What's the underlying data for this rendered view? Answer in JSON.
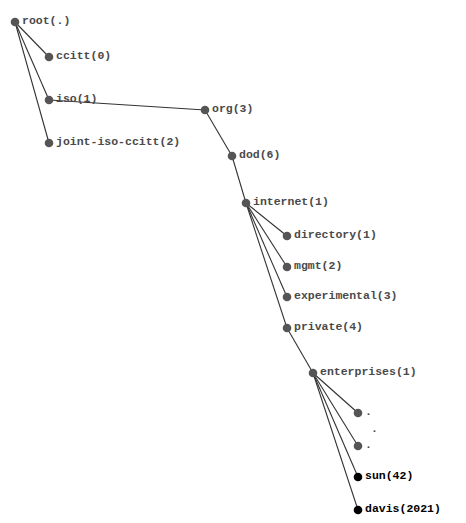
{
  "diagram": {
    "type": "tree",
    "title": "",
    "colors": {
      "node": "#555555",
      "highlight": "#000000",
      "edge": "#333333",
      "text": "#4a4a4a"
    },
    "nodes": [
      {
        "id": "root",
        "label": "root(.)",
        "x": 15,
        "y": 22,
        "highlight": false
      },
      {
        "id": "ccitt",
        "label": "ccitt(0)",
        "x": 49,
        "y": 57,
        "highlight": false
      },
      {
        "id": "iso",
        "label": "iso(1)",
        "x": 49,
        "y": 100,
        "highlight": false
      },
      {
        "id": "joint",
        "label": "joint-iso-ccitt(2)",
        "x": 49,
        "y": 143,
        "highlight": false
      },
      {
        "id": "org",
        "label": "org(3)",
        "x": 205,
        "y": 110,
        "highlight": false
      },
      {
        "id": "dod",
        "label": "dod(6)",
        "x": 232,
        "y": 156,
        "highlight": false
      },
      {
        "id": "internet",
        "label": "internet(1)",
        "x": 246,
        "y": 203,
        "highlight": false
      },
      {
        "id": "directory",
        "label": "directory(1)",
        "x": 287,
        "y": 236,
        "highlight": false
      },
      {
        "id": "mgmt",
        "label": "mgmt(2)",
        "x": 287,
        "y": 267,
        "highlight": false
      },
      {
        "id": "experimental",
        "label": "experimental(3)",
        "x": 287,
        "y": 297,
        "highlight": false
      },
      {
        "id": "private",
        "label": "private(4)",
        "x": 287,
        "y": 328,
        "highlight": false
      },
      {
        "id": "enterprises",
        "label": "enterprises(1)",
        "x": 313,
        "y": 373,
        "highlight": false
      },
      {
        "id": "dots1",
        "label": ".",
        "x": 358,
        "y": 413,
        "highlight": false
      },
      {
        "id": "dots2",
        "label": ".",
        "x": 358,
        "y": 446,
        "highlight": false
      },
      {
        "id": "sun",
        "label": "sun(42)",
        "x": 358,
        "y": 477,
        "highlight": true
      },
      {
        "id": "davis",
        "label": "davis(2021)",
        "x": 358,
        "y": 510,
        "highlight": true
      }
    ],
    "edges": [
      [
        "root",
        "ccitt"
      ],
      [
        "root",
        "iso"
      ],
      [
        "root",
        "joint"
      ],
      [
        "iso",
        "org"
      ],
      [
        "org",
        "dod"
      ],
      [
        "dod",
        "internet"
      ],
      [
        "internet",
        "directory"
      ],
      [
        "internet",
        "mgmt"
      ],
      [
        "internet",
        "experimental"
      ],
      [
        "internet",
        "private"
      ],
      [
        "private",
        "enterprises"
      ],
      [
        "enterprises",
        "dots1"
      ],
      [
        "enterprises",
        "dots2"
      ],
      [
        "enterprises",
        "sun"
      ],
      [
        "enterprises",
        "davis"
      ]
    ],
    "ellipsis": {
      "label": ".",
      "x": 374,
      "y": 430
    }
  }
}
